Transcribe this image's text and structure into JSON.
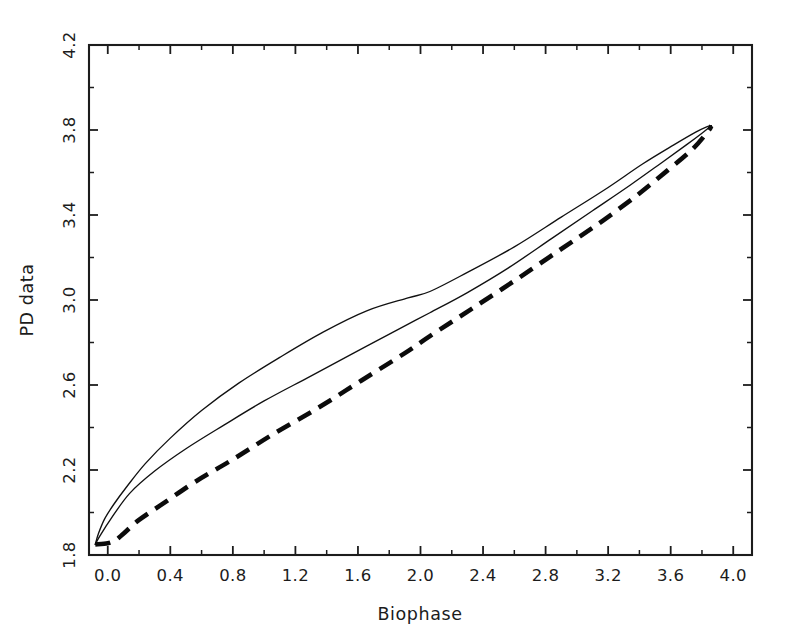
{
  "figure": {
    "background_color": "#ffffff",
    "foreground_color": "#1c1c1c",
    "width": 798,
    "height": 644
  },
  "chart_data": {
    "type": "line",
    "title": "",
    "subtitle": "",
    "xlabel": "Biophase",
    "ylabel": "PD data",
    "xlim": [
      -0.12,
      4.12
    ],
    "ylim": [
      1.8,
      4.2
    ],
    "xticks": [
      "0.0",
      "0.4",
      "0.8",
      "1.2",
      "1.6",
      "2.0",
      "2.4",
      "2.8",
      "3.2",
      "3.6",
      "4.0"
    ],
    "xtick_values": [
      0.0,
      0.4,
      0.8,
      1.2,
      1.6,
      2.0,
      2.4,
      2.8,
      3.2,
      3.6,
      4.0
    ],
    "yticks": [
      "1.8",
      "2.2",
      "2.6",
      "3.0",
      "3.4",
      "3.8",
      "4.2"
    ],
    "ytick_values": [
      1.8,
      2.2,
      2.6,
      3.0,
      3.4,
      3.8,
      4.2
    ],
    "minor_tick_step_x": 0.2,
    "minor_tick_step_y": 0.2,
    "grid": false,
    "legend": "none",
    "legend_position": "none",
    "annotations": [],
    "series": [
      {
        "name": "hysteresis-loop-upper-branch",
        "style": "solid",
        "linewidth": 1.35,
        "color": "#111111",
        "x": [
          -0.08,
          -0.06,
          -0.02,
          0.04,
          0.12,
          0.24,
          0.4,
          0.6,
          0.84,
          1.1,
          1.38,
          1.66,
          1.92,
          2.06,
          2.3,
          2.6,
          2.9,
          3.18,
          3.42,
          3.62,
          3.76,
          3.83,
          3.86
        ],
        "y": [
          1.85,
          1.9,
          1.97,
          2.04,
          2.12,
          2.23,
          2.35,
          2.48,
          2.61,
          2.73,
          2.85,
          2.95,
          3.01,
          3.04,
          3.13,
          3.25,
          3.39,
          3.52,
          3.64,
          3.73,
          3.79,
          3.815,
          3.82
        ]
      },
      {
        "name": "hysteresis-loop-lower-branch",
        "style": "solid",
        "linewidth": 1.35,
        "color": "#111111",
        "x": [
          3.86,
          3.8,
          3.7,
          3.54,
          3.34,
          3.1,
          2.84,
          2.56,
          2.3,
          2.06,
          1.84,
          1.56,
          1.28,
          1.0,
          0.74,
          0.5,
          0.3,
          0.14,
          0.02,
          -0.05,
          -0.08
        ],
        "y": [
          3.82,
          3.785,
          3.73,
          3.645,
          3.54,
          3.42,
          3.29,
          3.15,
          3.035,
          2.94,
          2.855,
          2.745,
          2.635,
          2.525,
          2.41,
          2.3,
          2.195,
          2.09,
          1.97,
          1.89,
          1.85
        ]
      },
      {
        "name": "pd-data-dashed-fit",
        "style": "dashed",
        "linewidth": 4.6,
        "color": "#0b0b0b",
        "x": [
          -0.08,
          0.0,
          0.05,
          0.1,
          0.2,
          0.36,
          0.56,
          0.8,
          1.06,
          1.34,
          1.62,
          1.9,
          2.06,
          2.32,
          2.6,
          2.88,
          3.14,
          3.38,
          3.58,
          3.74,
          3.84,
          3.86
        ],
        "y": [
          1.85,
          1.855,
          1.87,
          1.9,
          1.965,
          2.045,
          2.145,
          2.25,
          2.37,
          2.49,
          2.62,
          2.75,
          2.83,
          2.955,
          3.09,
          3.23,
          3.36,
          3.49,
          3.61,
          3.71,
          3.795,
          3.82
        ]
      }
    ]
  }
}
